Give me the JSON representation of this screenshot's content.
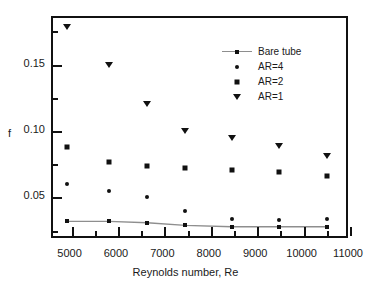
{
  "chart_data": {
    "type": "scatter",
    "title": "",
    "xlabel": "Reynolds number, Re",
    "ylabel": "f",
    "xlim": [
      4600,
      11000
    ],
    "ylim": [
      0.018,
      0.185
    ],
    "grid": false,
    "legend_position": "upper right",
    "x_ticks": [
      {
        "value": 5000,
        "label": "5000"
      },
      {
        "value": 6000,
        "label": "6000"
      },
      {
        "value": 7000,
        "label": "7000"
      },
      {
        "value": 8000,
        "label": "8000"
      },
      {
        "value": 9000,
        "label": "9000"
      },
      {
        "value": 10000,
        "label": "10000"
      },
      {
        "value": 11000,
        "label": "11000"
      }
    ],
    "x_minor_ticks": [
      5500,
      6500,
      7500,
      8500,
      9500,
      10500
    ],
    "y_ticks": [
      {
        "value": 0.05,
        "label": "0.05"
      },
      {
        "value": 0.1,
        "label": "0.10"
      },
      {
        "value": 0.15,
        "label": "0.15"
      }
    ],
    "y_minor_ticks": [
      0.025,
      0.075,
      0.125,
      0.175
    ],
    "x": [
      4900,
      5800,
      6630,
      7450,
      8450,
      9470,
      10500
    ],
    "series": [
      {
        "name": "Bare tube",
        "marker": "square",
        "line": true,
        "color": "#111111",
        "line_color": "#8e8e8e",
        "values": [
          0.032,
          0.032,
          0.031,
          0.029,
          0.028,
          0.028,
          0.028
        ]
      },
      {
        "name": "AR=4",
        "marker": "circle",
        "line": false,
        "color": "#111111",
        "values": [
          0.06,
          0.055,
          0.05,
          0.04,
          0.034,
          0.033,
          0.034
        ]
      },
      {
        "name": "AR=2",
        "marker": "square",
        "line": false,
        "color": "#111111",
        "values": [
          0.088,
          0.077,
          0.074,
          0.072,
          0.071,
          0.069,
          0.066
        ]
      },
      {
        "name": "AR=1",
        "marker": "triangle-down",
        "line": false,
        "color": "#111111",
        "values": [
          0.178,
          0.15,
          0.12,
          0.1,
          0.095,
          0.089,
          0.081
        ]
      }
    ]
  },
  "legend": {
    "entries": [
      {
        "label": "Bare tube"
      },
      {
        "label": "AR=4"
      },
      {
        "label": "AR=2"
      },
      {
        "label": "AR=1"
      }
    ]
  }
}
